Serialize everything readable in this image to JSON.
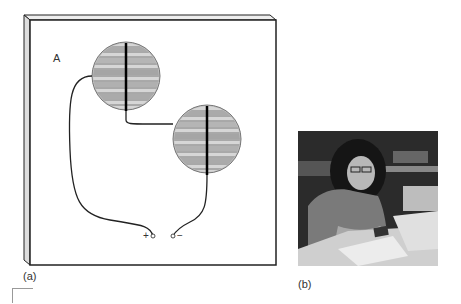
{
  "figure": {
    "panel_a": {
      "caption": "(a)",
      "board_label": "A",
      "terminal_positive": "+",
      "terminal_negative": "−",
      "cells": [
        {
          "name": "solar-cell-1",
          "cx": 126,
          "cy": 76,
          "r": 34
        },
        {
          "name": "solar-cell-2",
          "cx": 207,
          "cy": 139,
          "r": 34
        }
      ]
    },
    "panel_b": {
      "caption": "(b)",
      "description": "photo of student working with solar cell at desk"
    }
  }
}
